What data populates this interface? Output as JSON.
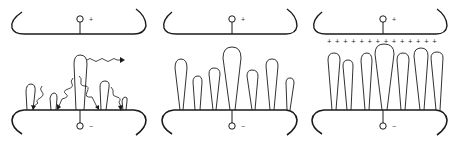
{
  "figure": {
    "type": "electrode discharge stages diagram",
    "colors": {
      "line": "#1a1a1a",
      "background": "#ffffff"
    },
    "panels": [
      {
        "id": "panel-1",
        "top_electrode_sign": "+",
        "bottom_electrode_sign": "−",
        "description": "Initial streamers with wavy photon/electron arrows",
        "has_arrows": true,
        "streamer_count": 5,
        "space_charge_signs": ""
      },
      {
        "id": "panel-2",
        "top_electrode_sign": "+",
        "bottom_electrode_sign": "−",
        "description": "Multiple streamers grown from cathode",
        "has_arrows": false,
        "streamer_count": 7,
        "space_charge_signs": ""
      },
      {
        "id": "panel-3",
        "top_electrode_sign": "+",
        "bottom_electrode_sign": "−",
        "description": "Streamers with positive space charge layer under anode",
        "has_arrows": false,
        "streamer_count": 7,
        "space_charge_signs": "+ + + + + + + + + + + + + +"
      }
    ]
  }
}
